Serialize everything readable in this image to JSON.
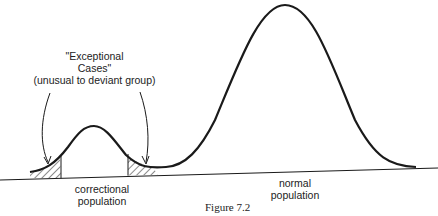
{
  "figure": {
    "caption": "Figure 7.2",
    "annotation": {
      "line1": "\"Exceptional",
      "line2": "Cases\"",
      "line3": "(unusual to deviant group)"
    },
    "labels": {
      "correctional_line1": "correctional",
      "correctional_line2": "population",
      "normal_line1": "normal",
      "normal_line2": "population"
    }
  },
  "colors": {
    "ink": "#1a1a1a",
    "background": "#ffffff"
  }
}
